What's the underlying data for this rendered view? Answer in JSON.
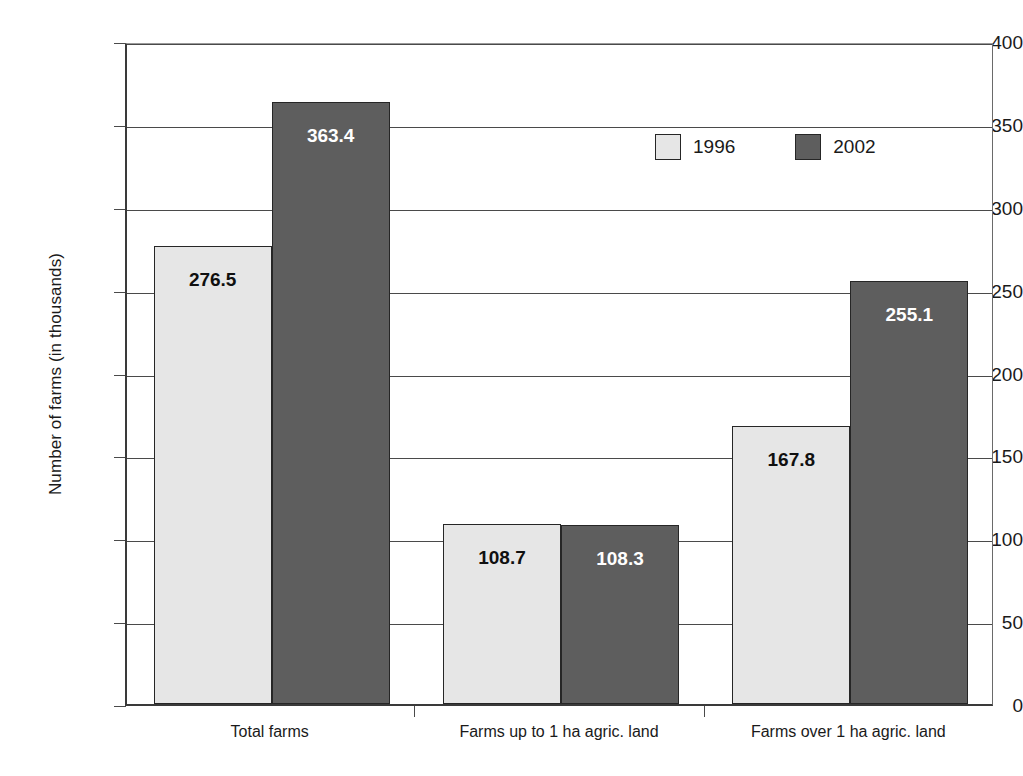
{
  "chart_data": {
    "type": "bar",
    "title": "",
    "xlabel": "",
    "ylabel": "Number of farms (in thousands)",
    "ylim": [
      0,
      400
    ],
    "ytick_step": 50,
    "yticks": [
      400,
      350,
      300,
      250,
      200,
      150,
      100,
      50,
      0
    ],
    "grid": "horizontal",
    "legend_position": "inside-top-right",
    "categories": [
      "Total farms",
      "Farms up to 1 ha agric. land",
      "Farms over 1 ha agric. land"
    ],
    "series": [
      {
        "name": "1996",
        "color": "#e6e6e6",
        "label_color": "#101010",
        "values": [
          276.5,
          108.7,
          167.8
        ],
        "value_labels": [
          "276.5",
          "108.7",
          "167.8"
        ]
      },
      {
        "name": "2002",
        "color": "#5e5e5e",
        "label_color": "#ffffff",
        "values": [
          363.4,
          108.3,
          255.1
        ],
        "value_labels": [
          "363.4",
          "108.3",
          "255.1"
        ]
      }
    ]
  },
  "axis": {
    "y_title": "Number of farms (in thousands)",
    "y_tick_labels": [
      "400",
      "350",
      "300",
      "250",
      "200",
      "150",
      "100",
      "50",
      "0"
    ]
  },
  "legend": {
    "items": [
      {
        "label": "1996",
        "swatch": "light"
      },
      {
        "label": "2002",
        "swatch": "dark"
      }
    ]
  },
  "caption": {
    "text": ""
  }
}
